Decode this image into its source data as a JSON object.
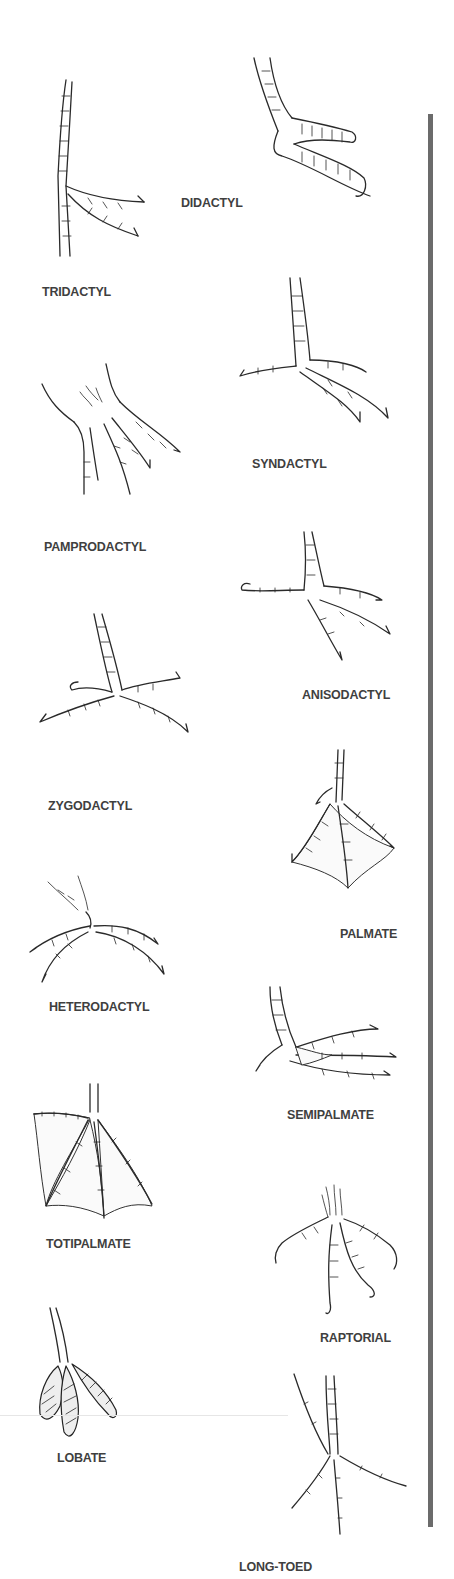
{
  "figure": {
    "type": "bird-foot-types-illustration",
    "divider_color": "#6b6b6b",
    "label_color": "#3f3f3f",
    "foot_types": [
      {
        "id": "tridactyl",
        "label": "TRIDACTYL",
        "column": "left"
      },
      {
        "id": "didactyl",
        "label": "DIDACTYL",
        "column": "right"
      },
      {
        "id": "syndactyl",
        "label": "SYNDACTYL",
        "column": "right"
      },
      {
        "id": "pamprodactyl",
        "label": "PAMPRODACTYL",
        "column": "left"
      },
      {
        "id": "anisodactyl",
        "label": "ANISODACTYL",
        "column": "right"
      },
      {
        "id": "zygodactyl",
        "label": "ZYGODACTYL",
        "column": "left"
      },
      {
        "id": "palmate",
        "label": "PALMATE",
        "column": "right"
      },
      {
        "id": "heterodactyl",
        "label": "HETERODACTYL",
        "column": "left"
      },
      {
        "id": "semipalmate",
        "label": "SEMIPALMATE",
        "column": "right"
      },
      {
        "id": "totipalmate",
        "label": "TOTIPALMATE",
        "column": "left"
      },
      {
        "id": "raptorial",
        "label": "RAPTORIAL",
        "column": "right"
      },
      {
        "id": "lobate",
        "label": "LOBATE",
        "column": "left"
      },
      {
        "id": "long_toed",
        "label": "LONG-TOED",
        "column": "right"
      }
    ]
  }
}
